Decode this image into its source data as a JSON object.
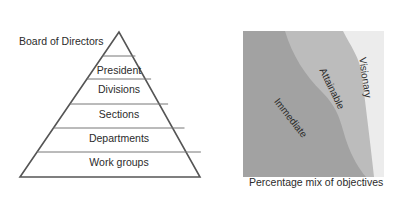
{
  "pyramid": {
    "top_label": "Board of Directors",
    "levels": [
      {
        "label": "President"
      },
      {
        "label": "Divisions"
      },
      {
        "label": "Sections"
      },
      {
        "label": "Departments"
      },
      {
        "label": "Work groups"
      }
    ],
    "line_color": "#555555"
  },
  "objectives_chart": {
    "caption": "Percentage mix of objectives",
    "regions": [
      {
        "label": "Immediate",
        "color": "#a3a3a3"
      },
      {
        "label": "Attainable",
        "color": "#bdbdbd"
      },
      {
        "label": "Visionary",
        "color": "#ededed"
      }
    ]
  }
}
